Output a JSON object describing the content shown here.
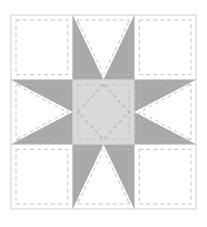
{
  "document": {
    "title": "Eight-Pointed Star Quilt Block",
    "type": "quilt-block-diagram"
  },
  "canvas": {
    "width": 207,
    "height": 227,
    "background": "#ffffff"
  },
  "palette": {
    "background": "#ffffff",
    "patch_plain": "#ffffff",
    "patch_star_point": "#a9a9a9",
    "patch_center": "#d8dad8",
    "seam_line": "#b9bbb9",
    "block_outline": "#c9cbc9",
    "grid_line": "#c4c6c4",
    "diamond_seam": "#9a9c9a"
  },
  "block": {
    "name": "eight-pointed-star",
    "grid_rows": 3,
    "grid_cols": 3,
    "x": 11,
    "y": 15,
    "width": 185,
    "height": 194,
    "seam_inset": 5,
    "dash_pattern": "4 3",
    "dash_width": 0.9
  },
  "cells": [
    {
      "name": "corner-top-left",
      "row": 0,
      "col": 0,
      "kind": "plain",
      "fill": "#ffffff",
      "seam_dashed": true
    },
    {
      "name": "star-point-top",
      "row": 0,
      "col": 1,
      "kind": "flying-geese",
      "orientation": "up",
      "fill": "#a9a9a9",
      "background_fill": "#ffffff",
      "seam_dashed": true
    },
    {
      "name": "corner-top-right",
      "row": 0,
      "col": 2,
      "kind": "plain",
      "fill": "#ffffff",
      "seam_dashed": true
    },
    {
      "name": "star-point-left",
      "row": 1,
      "col": 0,
      "kind": "flying-geese",
      "orientation": "left",
      "fill": "#a9a9a9",
      "background_fill": "#ffffff",
      "seam_dashed": true
    },
    {
      "name": "center-square",
      "row": 1,
      "col": 1,
      "kind": "center",
      "fill": "#d8dad8",
      "inner_motif": "diamond",
      "seam_dashed": true
    },
    {
      "name": "star-point-right",
      "row": 1,
      "col": 2,
      "kind": "flying-geese",
      "orientation": "right",
      "fill": "#a9a9a9",
      "background_fill": "#ffffff",
      "seam_dashed": true
    },
    {
      "name": "corner-bottom-left",
      "row": 2,
      "col": 0,
      "kind": "plain",
      "fill": "#ffffff",
      "seam_dashed": true
    },
    {
      "name": "star-point-bottom",
      "row": 2,
      "col": 1,
      "kind": "flying-geese",
      "orientation": "down",
      "fill": "#a9a9a9",
      "background_fill": "#ffffff",
      "seam_dashed": true
    },
    {
      "name": "corner-bottom-right",
      "row": 2,
      "col": 2,
      "kind": "plain",
      "fill": "#ffffff",
      "seam_dashed": true
    }
  ]
}
